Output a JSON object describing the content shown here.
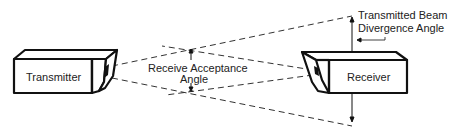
{
  "diagram": {
    "transmitter_label": "Transmitter",
    "receiver_label": "Receiver",
    "receive_angle_line1": "Receive Acceptance",
    "receive_angle_line2": "Angle",
    "beam_angle_line1": "Transmitted Beam",
    "beam_angle_line2": "Divergence Angle"
  },
  "colors": {
    "stroke": "#111111",
    "dash": "#333333",
    "background": "#ffffff"
  }
}
